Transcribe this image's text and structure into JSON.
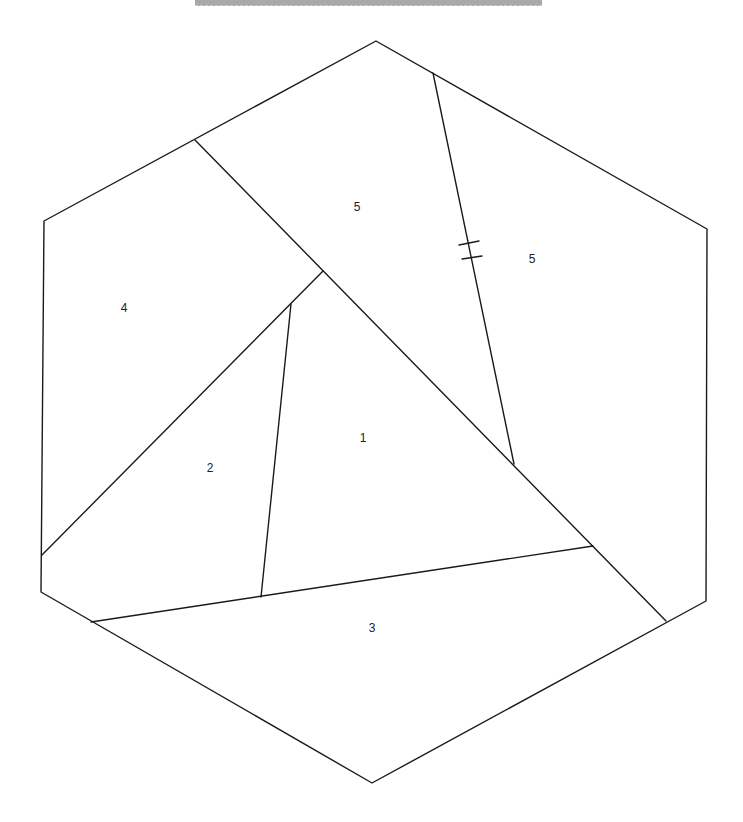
{
  "diagram": {
    "type": "hexagon-partition",
    "hexagon": [
      [
        376,
        41
      ],
      [
        707,
        229
      ],
      [
        706,
        601
      ],
      [
        372,
        783
      ],
      [
        41,
        592
      ],
      [
        44,
        221
      ]
    ],
    "cuts": [
      {
        "id": "top-left-to-bottom-right",
        "from": [
          195,
          140
        ],
        "to": [
          666,
          621
        ]
      },
      {
        "id": "top-split",
        "from": [
          433,
          73
        ],
        "to": [
          514,
          464
        ]
      },
      {
        "id": "left-diagonal",
        "from": [
          323,
          271
        ],
        "to": [
          42,
          555
        ]
      },
      {
        "id": "inner-2-1",
        "from": [
          291,
          304
        ],
        "to": [
          261,
          597
        ]
      },
      {
        "id": "bottom-strip",
        "from": [
          91,
          622
        ],
        "to": [
          593,
          546
        ]
      }
    ],
    "tick_marks": [
      {
        "from": [
          459,
          245
        ],
        "to": [
          479,
          241
        ]
      },
      {
        "from": [
          462,
          259
        ],
        "to": [
          482,
          256
        ]
      }
    ],
    "regions": [
      {
        "label": "1",
        "x": 363,
        "y": 438
      },
      {
        "label": "2",
        "x": 210,
        "y": 468
      },
      {
        "label": "3",
        "x": 372,
        "y": 628
      },
      {
        "label": "4",
        "x": 124,
        "y": 308
      },
      {
        "label": "5",
        "x": 357,
        "y": 207
      },
      {
        "label": "5",
        "x": 532,
        "y": 259
      }
    ]
  }
}
